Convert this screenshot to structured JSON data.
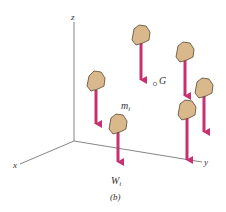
{
  "figure": {
    "caption": "(b)",
    "axes": {
      "z_label": "z",
      "x_label": "x",
      "y_label": "y",
      "color": "#555555"
    },
    "center_of_gravity": {
      "label": "G"
    },
    "particle_labels": {
      "mass": "m",
      "mass_sub": "i",
      "weight": "W",
      "weight_sub": "i"
    },
    "colors": {
      "arrow": "#c8306e",
      "rock_fill": "#d9b98c",
      "rock_outline": "#5a4630"
    },
    "particles": [
      {
        "id": 1,
        "rock": [
          95,
          82
        ],
        "arrow_end": 130
      },
      {
        "id": 2,
        "rock": [
          140,
          35
        ],
        "arrow_end": 86
      },
      {
        "id": 3,
        "rock": [
          184,
          52
        ],
        "arrow_end": 102
      },
      {
        "id": 4,
        "rock": [
          203,
          88
        ],
        "arrow_end": 138
      },
      {
        "id": 5,
        "rock": [
          187,
          110
        ],
        "arrow_end": 166
      },
      {
        "id": 6,
        "rock": [
          118,
          124
        ],
        "arrow_end": 168,
        "labeled": true
      }
    ]
  }
}
